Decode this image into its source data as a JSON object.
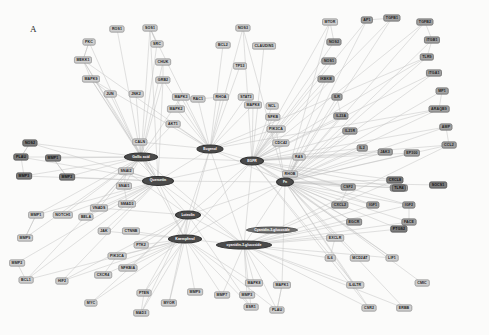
{
  "figure": {
    "panel_label": "A",
    "width": 489,
    "height": 335,
    "background_color": "#fbfbfa",
    "edge_color": "#b0b0b0",
    "gene_node_color": "#b9b9b9",
    "hub_node_color": "#4a4a4a"
  },
  "chart_data": {
    "type": "diagram",
    "subtype": "network-graph",
    "legend": [],
    "node_count": 118,
    "hub_nodes": [
      {
        "id": "gallic_acid",
        "label": "Gallic acid",
        "x": 141,
        "y": 157,
        "shape": "ellipse",
        "w": 34,
        "h": 9
      },
      {
        "id": "eugenol",
        "label": "Eugenol",
        "x": 210,
        "y": 149,
        "shape": "ellipse",
        "w": 27,
        "h": 9
      },
      {
        "id": "egfr",
        "label": "EGFR",
        "x": 252,
        "y": 161,
        "shape": "ellipse",
        "w": 24,
        "h": 9
      },
      {
        "id": "quercetin",
        "label": "Quercetin",
        "x": 158,
        "y": 181,
        "shape": "ellipse",
        "w": 32,
        "h": 10
      },
      {
        "id": "fn",
        "label": "Fn",
        "x": 285,
        "y": 182,
        "shape": "ellipse",
        "w": 18,
        "h": 9
      },
      {
        "id": "luteolin",
        "label": "Luteolin",
        "x": 188,
        "y": 215,
        "shape": "ellipse",
        "w": 26,
        "h": 9
      },
      {
        "id": "kaempferol",
        "label": "Kaempferol",
        "x": 185,
        "y": 239,
        "shape": "ellipse",
        "w": 34,
        "h": 9
      },
      {
        "id": "cyanidin_3_glucoside",
        "label": "cyanidin-3-glucoside",
        "x": 244,
        "y": 245,
        "shape": "ellipse",
        "w": 56,
        "h": 9
      },
      {
        "id": "cyanidin_3_glucoside_b",
        "label": "Cyanidin-3-glucoside",
        "x": 272,
        "y": 230,
        "shape": "label",
        "w": 52,
        "h": 7
      }
    ],
    "gene_nodes": [
      {
        "label": "ROS1",
        "x": 117,
        "y": 29,
        "tone": "light"
      },
      {
        "label": "SOS1",
        "x": 150,
        "y": 28,
        "tone": "light"
      },
      {
        "label": "PKC",
        "x": 89,
        "y": 42,
        "tone": "light"
      },
      {
        "label": "SRC",
        "x": 157,
        "y": 44,
        "tone": "light"
      },
      {
        "label": "MEKK1",
        "x": 83,
        "y": 60,
        "tone": "light"
      },
      {
        "label": "CHUK",
        "x": 163,
        "y": 62,
        "tone": "light"
      },
      {
        "label": "MAPK9",
        "x": 91,
        "y": 79,
        "tone": "light"
      },
      {
        "label": "GRB2",
        "x": 163,
        "y": 80,
        "tone": "light"
      },
      {
        "label": "JUN",
        "x": 110,
        "y": 94,
        "tone": "light"
      },
      {
        "label": "JNK2",
        "x": 136,
        "y": 94,
        "tone": "light"
      },
      {
        "label": "MAPK3",
        "x": 181,
        "y": 97,
        "tone": "light"
      },
      {
        "label": "MAPK2",
        "x": 176,
        "y": 109,
        "tone": "light"
      },
      {
        "label": "AKT1",
        "x": 173,
        "y": 124,
        "tone": "light"
      },
      {
        "label": "CALN",
        "x": 140,
        "y": 142,
        "tone": "light"
      },
      {
        "label": "VIM",
        "x": 134,
        "y": 157,
        "tone": "light"
      },
      {
        "label": "SNAI2",
        "x": 126,
        "y": 171,
        "tone": "light"
      },
      {
        "label": "SNAI1",
        "x": 124,
        "y": 186,
        "tone": "light"
      },
      {
        "label": "SMAD3",
        "x": 127,
        "y": 204,
        "tone": "light"
      },
      {
        "label": "BCL2",
        "x": 223,
        "y": 45,
        "tone": "light"
      },
      {
        "label": "CLAUDIN5",
        "x": 264,
        "y": 46,
        "tone": "light"
      },
      {
        "label": "NOS3",
        "x": 243,
        "y": 28,
        "tone": "light"
      },
      {
        "label": "TP53",
        "x": 240,
        "y": 66,
        "tone": "light"
      },
      {
        "label": "RAC1",
        "x": 198,
        "y": 99,
        "tone": "light"
      },
      {
        "label": "RHOA",
        "x": 221,
        "y": 97,
        "tone": "light"
      },
      {
        "label": "STAT3",
        "x": 246,
        "y": 97,
        "tone": "light"
      },
      {
        "label": "MAPK8",
        "x": 253,
        "y": 105,
        "tone": "light"
      },
      {
        "label": "NCL",
        "x": 272,
        "y": 106,
        "tone": "light"
      },
      {
        "label": "NFKB",
        "x": 273,
        "y": 117,
        "tone": "light"
      },
      {
        "label": "PIK3CA",
        "x": 276,
        "y": 129,
        "tone": "light"
      },
      {
        "label": "CDC42",
        "x": 281,
        "y": 143,
        "tone": "light"
      },
      {
        "label": "RAS",
        "x": 299,
        "y": 157,
        "tone": "light"
      },
      {
        "label": "RHOB",
        "x": 290,
        "y": 174,
        "tone": "light"
      },
      {
        "label": "MTOR",
        "x": 330,
        "y": 22,
        "tone": "light"
      },
      {
        "label": "AP1",
        "x": 367,
        "y": 20,
        "tone": "mid"
      },
      {
        "label": "TGFB1",
        "x": 392,
        "y": 18,
        "tone": "mid"
      },
      {
        "label": "TGFB2",
        "x": 425,
        "y": 22,
        "tone": "mid"
      },
      {
        "label": "NOS2",
        "x": 334,
        "y": 42,
        "tone": "mid"
      },
      {
        "label": "ITGB1",
        "x": 432,
        "y": 40,
        "tone": "mid"
      },
      {
        "label": "NOS1",
        "x": 329,
        "y": 61,
        "tone": "mid"
      },
      {
        "label": "TLR9",
        "x": 427,
        "y": 57,
        "tone": "mid"
      },
      {
        "label": "IKBKB",
        "x": 326,
        "y": 79,
        "tone": "mid"
      },
      {
        "label": "ITGA1",
        "x": 434,
        "y": 73,
        "tone": "mid"
      },
      {
        "label": "ILR",
        "x": 337,
        "y": 97,
        "tone": "mid"
      },
      {
        "label": "MP1",
        "x": 442,
        "y": 91,
        "tone": "mid"
      },
      {
        "label": "IL23A",
        "x": 341,
        "y": 116,
        "tone": "mid"
      },
      {
        "label": "ARAQB9",
        "x": 439,
        "y": 109,
        "tone": "mid"
      },
      {
        "label": "IL21R",
        "x": 350,
        "y": 131,
        "tone": "mid"
      },
      {
        "label": "AMP",
        "x": 446,
        "y": 127,
        "tone": "mid"
      },
      {
        "label": "IL2",
        "x": 362,
        "y": 148,
        "tone": "mid"
      },
      {
        "label": "CCL2",
        "x": 449,
        "y": 145,
        "tone": "mid"
      },
      {
        "label": "JAK3",
        "x": 385,
        "y": 152,
        "tone": "mid"
      },
      {
        "label": "EP300",
        "x": 412,
        "y": 153,
        "tone": "mid"
      },
      {
        "label": "CSF2",
        "x": 348,
        "y": 187,
        "tone": "mid"
      },
      {
        "label": "EDNRA",
        "x": 399,
        "y": 188,
        "tone": "mid"
      },
      {
        "label": "CXCL2",
        "x": 340,
        "y": 205,
        "tone": "mid"
      },
      {
        "label": "IGF1",
        "x": 373,
        "y": 205,
        "tone": "mid"
      },
      {
        "label": "IGF2",
        "x": 409,
        "y": 205,
        "tone": "mid"
      },
      {
        "label": "EGCR",
        "x": 354,
        "y": 222,
        "tone": "mid"
      },
      {
        "label": "FACE",
        "x": 409,
        "y": 222,
        "tone": "mid"
      },
      {
        "label": "EXCLR",
        "x": 335,
        "y": 238,
        "tone": "light"
      },
      {
        "label": "MCD2AT",
        "x": 360,
        "y": 258,
        "tone": "light"
      },
      {
        "label": "LIF1",
        "x": 392,
        "y": 258,
        "tone": "light"
      },
      {
        "label": "IL6",
        "x": 330,
        "y": 258,
        "tone": "light"
      },
      {
        "label": "IL6LTR",
        "x": 355,
        "y": 285,
        "tone": "light"
      },
      {
        "label": "CMIC",
        "x": 422,
        "y": 283,
        "tone": "light"
      },
      {
        "label": "CSR2",
        "x": 369,
        "y": 308,
        "tone": "light"
      },
      {
        "label": "ERBB",
        "x": 404,
        "y": 308,
        "tone": "light"
      },
      {
        "label": "NOTCH1",
        "x": 63,
        "y": 215,
        "tone": "light"
      },
      {
        "label": "MMP1",
        "x": 36,
        "y": 215,
        "tone": "light"
      },
      {
        "label": "MMP9",
        "x": 25,
        "y": 238,
        "tone": "light"
      },
      {
        "label": "JAK",
        "x": 104,
        "y": 231,
        "tone": "light"
      },
      {
        "label": "BELA",
        "x": 86,
        "y": 217,
        "tone": "light"
      },
      {
        "label": "VNADS",
        "x": 99,
        "y": 208,
        "tone": "light"
      },
      {
        "label": "CTNNB",
        "x": 131,
        "y": 231,
        "tone": "light"
      },
      {
        "label": "PTK2",
        "x": 141,
        "y": 245,
        "tone": "light"
      },
      {
        "label": "PIK3CA",
        "x": 117,
        "y": 256,
        "tone": "light"
      },
      {
        "label": "NFKBIA",
        "x": 128,
        "y": 268,
        "tone": "light"
      },
      {
        "label": "MMP2",
        "x": 17,
        "y": 263,
        "tone": "light"
      },
      {
        "label": "BCL1",
        "x": 26,
        "y": 280,
        "tone": "light"
      },
      {
        "label": "HIF2",
        "x": 62,
        "y": 281,
        "tone": "light"
      },
      {
        "label": "CXCR4",
        "x": 103,
        "y": 275,
        "tone": "light"
      },
      {
        "label": "MYC",
        "x": 91,
        "y": 303,
        "tone": "light"
      },
      {
        "label": "PTEN",
        "x": 144,
        "y": 293,
        "tone": "light"
      },
      {
        "label": "MYOR",
        "x": 169,
        "y": 303,
        "tone": "light"
      },
      {
        "label": "MAD3",
        "x": 141,
        "y": 313,
        "tone": "light"
      },
      {
        "label": "MMP9",
        "x": 195,
        "y": 292,
        "tone": "light"
      },
      {
        "label": "MMP7",
        "x": 222,
        "y": 295,
        "tone": "light"
      },
      {
        "label": "MMP3",
        "x": 247,
        "y": 295,
        "tone": "light"
      },
      {
        "label": "MAPK8",
        "x": 254,
        "y": 283,
        "tone": "light"
      },
      {
        "label": "MAPK1",
        "x": 282,
        "y": 285,
        "tone": "light"
      },
      {
        "label": "ESR1",
        "x": 251,
        "y": 307,
        "tone": "light"
      },
      {
        "label": "PLAU",
        "x": 277,
        "y": 310,
        "tone": "light"
      },
      {
        "label": "NOS2",
        "x": 30,
        "y": 143,
        "tone": "dark"
      },
      {
        "label": "PLAU",
        "x": 21,
        "y": 157,
        "tone": "dark"
      },
      {
        "label": "MMP1",
        "x": 53,
        "y": 158,
        "tone": "dark"
      },
      {
        "label": "MMP3",
        "x": 24,
        "y": 176,
        "tone": "dark"
      },
      {
        "label": "MMP2",
        "x": 67,
        "y": 177,
        "tone": "dark"
      },
      {
        "label": "TLR4",
        "x": 399,
        "y": 188,
        "tone": "dark"
      },
      {
        "label": "CXCL8",
        "x": 395,
        "y": 180,
        "tone": "dark"
      },
      {
        "label": "SOCS1",
        "x": 438,
        "y": 185,
        "tone": "dark"
      },
      {
        "label": "PTGS2",
        "x": 399,
        "y": 229,
        "tone": "dark"
      }
    ]
  }
}
